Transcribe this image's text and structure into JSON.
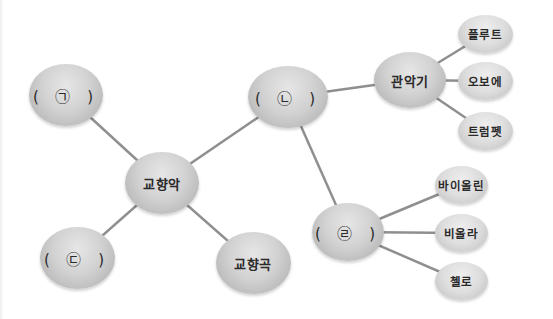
{
  "diagram": {
    "type": "mind-map",
    "nodes": {
      "center": "교향악",
      "blank_a": "( ㉠ )",
      "blank_b": "( ㉡ )",
      "blank_c": "( ㉢ )",
      "symphony": "교향곡",
      "brass_wind": "관악기",
      "flute": "플루트",
      "oboe": "오보에",
      "trumpet": "트럼펫",
      "blank_d": "( ㉣ )",
      "violin": "바이올린",
      "viola": "비올라",
      "cello": "첼로"
    },
    "edges": [
      [
        "center",
        "blank_a"
      ],
      [
        "center",
        "blank_b"
      ],
      [
        "center",
        "blank_c"
      ],
      [
        "center",
        "symphony"
      ],
      [
        "blank_b",
        "brass_wind"
      ],
      [
        "blank_b",
        "blank_d"
      ],
      [
        "brass_wind",
        "flute"
      ],
      [
        "brass_wind",
        "oboe"
      ],
      [
        "brass_wind",
        "trumpet"
      ],
      [
        "blank_d",
        "violin"
      ],
      [
        "blank_d",
        "viola"
      ],
      [
        "blank_d",
        "cello"
      ]
    ],
    "colors": {
      "node_fill": "#cfcfcf",
      "link": "#8f8f8f",
      "text": "#2a2a2a"
    }
  }
}
